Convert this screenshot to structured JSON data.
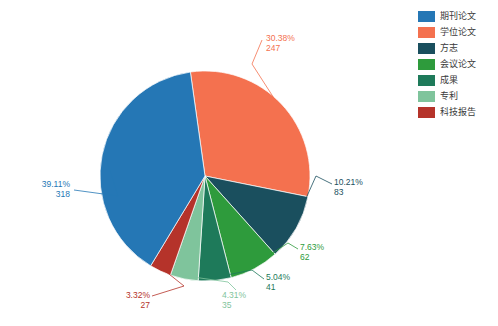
{
  "chart_data": {
    "type": "pie",
    "title": "",
    "subtitle": "",
    "xlabel": "",
    "ylabel": "",
    "total": 813,
    "legend_position": "right",
    "grid": false,
    "categories": [
      "期刊论文",
      "学位论文",
      "方志",
      "会议论文",
      "成果",
      "专利",
      "科技报告"
    ],
    "values": [
      318,
      247,
      83,
      62,
      41,
      35,
      27
    ],
    "percents": [
      "39.11%",
      "30.38%",
      "10.21%",
      "7.63%",
      "5.04%",
      "4.31%",
      "3.32%"
    ],
    "colors": [
      "#2577b5",
      "#f4714f",
      "#1a4f5e",
      "#2e9b3c",
      "#1e7a5a",
      "#7fc49c",
      "#b5332a"
    ],
    "slices": [
      {
        "label": "期刊论文",
        "value": 318,
        "percent": "39.11%",
        "count": "318",
        "color": "#2577b5"
      },
      {
        "label": "学位论文",
        "value": 247,
        "percent": "30.38%",
        "count": "247",
        "color": "#f4714f"
      },
      {
        "label": "方志",
        "value": 83,
        "percent": "10.21%",
        "count": "83",
        "color": "#1a4f5e"
      },
      {
        "label": "会议论文",
        "value": 62,
        "percent": "7.63%",
        "count": "62",
        "color": "#2e9b3c"
      },
      {
        "label": "成果",
        "value": 41,
        "percent": "5.04%",
        "count": "41",
        "color": "#1e7a5a"
      },
      {
        "label": "专利",
        "value": 35,
        "percent": "4.31%",
        "count": "35",
        "color": "#7fc49c"
      },
      {
        "label": "科技报告",
        "value": 27,
        "percent": "3.32%",
        "count": "27",
        "color": "#b5332a"
      }
    ]
  },
  "legend": {
    "items": [
      {
        "label": "期刊论文",
        "color": "#2577b5"
      },
      {
        "label": "学位论文",
        "color": "#f4714f"
      },
      {
        "label": "方志",
        "color": "#1a4f5e"
      },
      {
        "label": "会议论文",
        "color": "#2e9b3c"
      },
      {
        "label": "成果",
        "color": "#1e7a5a"
      },
      {
        "label": "专利",
        "color": "#7fc49c"
      },
      {
        "label": "科技报告",
        "color": "#b5332a"
      }
    ]
  },
  "labels": {
    "journal": {
      "percent": "39.11%",
      "count": "318"
    },
    "thesis": {
      "percent": "30.38%",
      "count": "247"
    },
    "chronicle": {
      "percent": "10.21%",
      "count": "83"
    },
    "conference": {
      "percent": "7.63%",
      "count": "62"
    },
    "achievement": {
      "percent": "5.04%",
      "count": "41"
    },
    "patent": {
      "percent": "4.31%",
      "count": "35"
    },
    "techreport": {
      "percent": "3.32%",
      "count": "27"
    }
  }
}
